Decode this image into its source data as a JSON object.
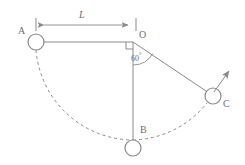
{
  "figure": {
    "kind": "physics-diagram",
    "stroke_color": "#8a8a8a",
    "text_color": "#6e6e6e",
    "background_color": "#ffffff",
    "width": 245,
    "height": 165
  },
  "labels": {
    "point_a": "A",
    "point_o": "O",
    "point_b": "B",
    "point_c": "C",
    "dimension_length": "L",
    "angle_value": "60",
    "angle_degree_symbol": "°"
  },
  "geometry": {
    "pivot": {
      "x": 133,
      "y": 42
    },
    "radius_px": 98,
    "bob_radius_px": 8,
    "bob_a": {
      "x": 36,
      "y": 42
    },
    "bob_b": {
      "x": 133,
      "y": 148
    },
    "bob_c": {
      "x": 213,
      "y": 96
    },
    "dimension_line_y": 25,
    "dimension_from_x": 36,
    "dimension_to_x": 134,
    "velocity_arrow_from": {
      "x": 218,
      "y": 90
    },
    "velocity_arrow_to": {
      "x": 230,
      "y": 70
    },
    "angle_from_vertical_deg": 60,
    "right_angle_marker": {
      "x": 133,
      "y": 42,
      "size": 7
    }
  }
}
